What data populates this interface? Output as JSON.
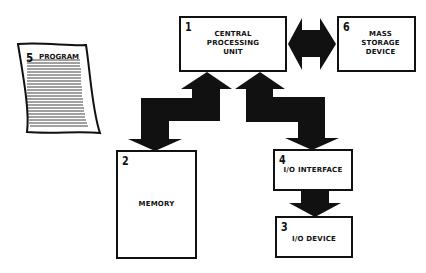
{
  "diagram": {
    "type": "computer-system-block-diagram",
    "colors": {
      "ink": "#111111",
      "background": "#ffffff"
    },
    "blocks": [
      {
        "id": "cpu",
        "number": "1",
        "label": "CENTRAL\nPROCESSING\nUNIT"
      },
      {
        "id": "memory",
        "number": "2",
        "label": "MEMORY"
      },
      {
        "id": "io_device",
        "number": "3",
        "label": "I/O DEVICE"
      },
      {
        "id": "io_interface",
        "number": "4",
        "label": "I/O INTERFACE"
      },
      {
        "id": "program",
        "number": "5",
        "label": "PROGRAM"
      },
      {
        "id": "mass_storage",
        "number": "6",
        "label": "MASS\nSTORAGE\nDEVICE"
      }
    ],
    "connections": [
      {
        "from": "cpu",
        "to": "memory",
        "direction": "bidirectional"
      },
      {
        "from": "cpu",
        "to": "io_interface",
        "direction": "bidirectional"
      },
      {
        "from": "cpu",
        "to": "mass_storage",
        "direction": "bidirectional"
      },
      {
        "from": "io_interface",
        "to": "io_device",
        "direction": "one-way"
      }
    ]
  }
}
